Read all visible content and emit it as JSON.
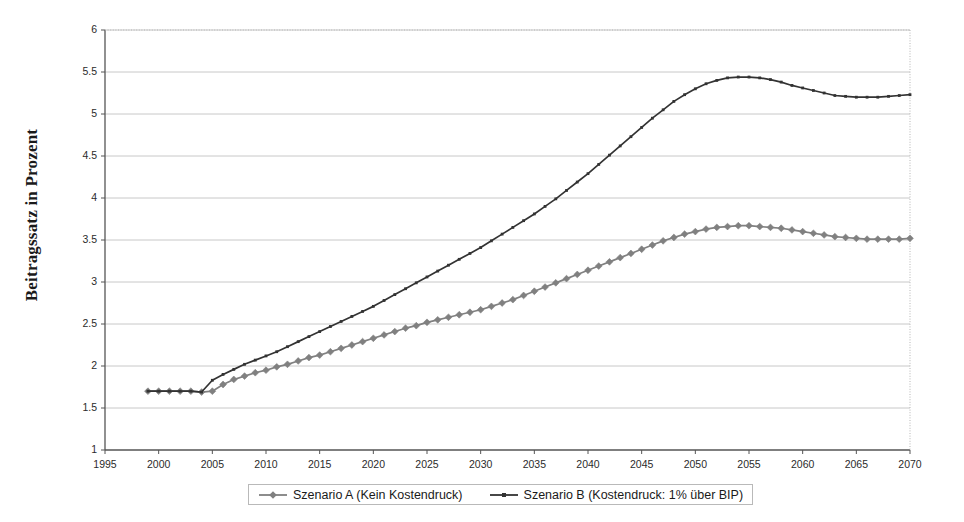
{
  "chart_data": {
    "type": "line",
    "title": "",
    "subtitle": "",
    "xlabel": "",
    "ylabel": "Beitragssatz in Prozent",
    "xlim": [
      1995,
      2070
    ],
    "ylim": [
      1,
      6
    ],
    "xticks": [
      1995,
      2000,
      2005,
      2010,
      2015,
      2020,
      2025,
      2030,
      2035,
      2040,
      2045,
      2050,
      2055,
      2060,
      2065,
      2070
    ],
    "yticks": [
      1,
      1.5,
      2,
      2.5,
      3,
      3.5,
      4,
      4.5,
      5,
      5.5,
      6
    ],
    "grid": "horizontal",
    "legend_position": "bottom",
    "x": [
      1999,
      2000,
      2001,
      2002,
      2003,
      2004,
      2005,
      2006,
      2007,
      2008,
      2009,
      2010,
      2011,
      2012,
      2013,
      2014,
      2015,
      2016,
      2017,
      2018,
      2019,
      2020,
      2021,
      2022,
      2023,
      2024,
      2025,
      2026,
      2027,
      2028,
      2029,
      2030,
      2031,
      2032,
      2033,
      2034,
      2035,
      2036,
      2037,
      2038,
      2039,
      2040,
      2041,
      2042,
      2043,
      2044,
      2045,
      2046,
      2047,
      2048,
      2049,
      2050,
      2051,
      2052,
      2053,
      2054,
      2055,
      2056,
      2057,
      2058,
      2059,
      2060,
      2061,
      2062,
      2063,
      2064,
      2065,
      2066,
      2067,
      2068,
      2069,
      2070
    ],
    "series": [
      {
        "name": "Szenario A (Kein Kostendruck)",
        "color": "#808080",
        "marker": "diamond",
        "values": [
          1.7,
          1.7,
          1.7,
          1.7,
          1.7,
          1.69,
          1.7,
          1.78,
          1.84,
          1.88,
          1.92,
          1.95,
          1.99,
          2.02,
          2.06,
          2.1,
          2.13,
          2.17,
          2.21,
          2.25,
          2.29,
          2.33,
          2.37,
          2.41,
          2.45,
          2.48,
          2.52,
          2.55,
          2.58,
          2.61,
          2.64,
          2.67,
          2.71,
          2.75,
          2.79,
          2.84,
          2.89,
          2.94,
          2.99,
          3.04,
          3.09,
          3.14,
          3.19,
          3.24,
          3.29,
          3.34,
          3.39,
          3.44,
          3.49,
          3.53,
          3.57,
          3.6,
          3.63,
          3.65,
          3.66,
          3.67,
          3.67,
          3.66,
          3.65,
          3.64,
          3.62,
          3.6,
          3.58,
          3.56,
          3.54,
          3.53,
          3.52,
          3.51,
          3.51,
          3.51,
          3.51,
          3.52
        ]
      },
      {
        "name": "Szenario B (Kostendruck: 1% über BIP)",
        "color": "#333333",
        "marker": "dot",
        "values": [
          1.7,
          1.7,
          1.7,
          1.7,
          1.7,
          1.69,
          1.83,
          1.9,
          1.96,
          2.02,
          2.07,
          2.12,
          2.17,
          2.23,
          2.29,
          2.35,
          2.41,
          2.47,
          2.53,
          2.59,
          2.65,
          2.71,
          2.78,
          2.85,
          2.92,
          2.99,
          3.06,
          3.13,
          3.2,
          3.27,
          3.34,
          3.41,
          3.49,
          3.57,
          3.65,
          3.73,
          3.81,
          3.9,
          3.99,
          4.09,
          4.19,
          4.29,
          4.4,
          4.51,
          4.62,
          4.73,
          4.84,
          4.95,
          5.05,
          5.15,
          5.23,
          5.3,
          5.36,
          5.4,
          5.43,
          5.44,
          5.44,
          5.43,
          5.41,
          5.38,
          5.34,
          5.31,
          5.28,
          5.25,
          5.22,
          5.21,
          5.2,
          5.2,
          5.2,
          5.21,
          5.22,
          5.23
        ]
      }
    ]
  },
  "legend": {
    "items": [
      {
        "label": "Szenario A (Kein Kostendruck)",
        "color": "#808080",
        "marker": "diamond"
      },
      {
        "label": "Szenario B (Kostendruck: 1% über BIP)",
        "color": "#333333",
        "marker": "dot"
      }
    ]
  }
}
